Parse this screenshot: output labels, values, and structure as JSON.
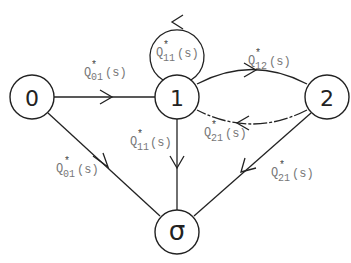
{
  "diagram": {
    "type": "state-transition-diagram",
    "nodes": [
      {
        "id": "0",
        "label": "0",
        "cx": 32,
        "cy": 97,
        "r": 22
      },
      {
        "id": "1",
        "label": "1",
        "cx": 177,
        "cy": 97,
        "r": 22
      },
      {
        "id": "2",
        "label": "2",
        "cx": 327,
        "cy": 97,
        "r": 22
      },
      {
        "id": "sigma",
        "label": "σ",
        "cx": 177,
        "cy": 232,
        "r": 22
      }
    ],
    "edges": [
      {
        "id": "e-0-1",
        "from": "0",
        "to": "1",
        "label": {
          "base": "Q",
          "sub": "01",
          "sup": "*",
          "arg": "(s)"
        }
      },
      {
        "id": "e-1-1",
        "from": "1",
        "to": "1",
        "label": {
          "base": "Q",
          "sub": "11",
          "sup": "*",
          "arg": "(s)"
        }
      },
      {
        "id": "e-1-2",
        "from": "1",
        "to": "2",
        "label": {
          "base": "Q",
          "sub": "12",
          "sup": "*",
          "arg": "(s)"
        }
      },
      {
        "id": "e-2-1",
        "from": "2",
        "to": "1",
        "label": {
          "base": "Q",
          "sub": "21",
          "sup": "*",
          "arg": "(s)"
        }
      },
      {
        "id": "e-0-sigma",
        "from": "0",
        "to": "sigma",
        "label": {
          "base": "Q",
          "sub": "01",
          "sup": "*",
          "arg": "(s)"
        }
      },
      {
        "id": "e-1-sigma",
        "from": "1",
        "to": "sigma",
        "label": {
          "base": "Q",
          "sub": "11",
          "sup": "*",
          "arg": "(s)"
        }
      },
      {
        "id": "e-2-sigma",
        "from": "2",
        "to": "sigma",
        "label": {
          "base": "Q",
          "sub": "21",
          "sup": "*",
          "arg": "(s)"
        }
      }
    ]
  }
}
